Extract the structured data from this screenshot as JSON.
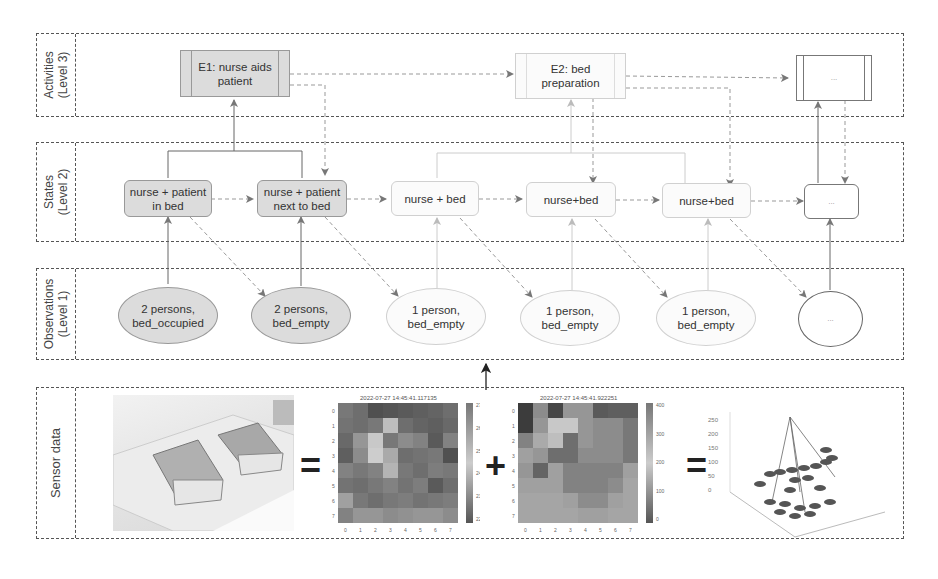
{
  "layers": {
    "activities": "Activities\n(Level 3)",
    "states": "States\n(Level 2)",
    "observations": "Observations\n(Level 1)",
    "sensor": "Sensor data"
  },
  "activities": [
    {
      "label": "E1: nurse aids\npatient",
      "style": "filled"
    },
    {
      "label": "E2: bed\npreparation",
      "style": "light"
    },
    {
      "label": "...",
      "style": "outline"
    }
  ],
  "states": [
    {
      "label": "nurse + patient\nin bed",
      "style": "filled"
    },
    {
      "label": "nurse + patient\nnext to bed",
      "style": "filled"
    },
    {
      "label": "nurse + bed",
      "style": "light"
    },
    {
      "label": "nurse+bed",
      "style": "light"
    },
    {
      "label": "nurse+bed",
      "style": "light"
    },
    {
      "label": "...",
      "style": "outline"
    }
  ],
  "observations": [
    {
      "label": "2 persons,\nbed_occupied",
      "style": "filled"
    },
    {
      "label": "2 persons,\nbed_empty",
      "style": "filled"
    },
    {
      "label": "1 person,\nbed_empty",
      "style": "light"
    },
    {
      "label": "1 person,\nbed_empty",
      "style": "light"
    },
    {
      "label": "1 person,\nbed_empty",
      "style": "light"
    },
    {
      "label": "...",
      "style": "outline"
    }
  ],
  "sensor": {
    "operators": [
      "=",
      "+",
      "="
    ],
    "heatmap1": {
      "title": "2022-07-27 14:45:41.117135",
      "colorbar_ticks": [
        "27",
        "26",
        "25",
        "24",
        "23",
        "22"
      ],
      "x_ticks": [
        "0",
        "1",
        "2",
        "3",
        "4",
        "5",
        "6",
        "7"
      ],
      "y_ticks": [
        "0",
        "1",
        "2",
        "3",
        "4",
        "5",
        "6",
        "7"
      ]
    },
    "heatmap2": {
      "title": "2022-07-27 14:45:41.922251",
      "colorbar_ticks": [
        "400",
        "300",
        "200",
        "100",
        "0"
      ],
      "x_ticks": [
        "0",
        "1",
        "2",
        "3",
        "4",
        "5",
        "6",
        "7"
      ],
      "y_ticks": [
        "0",
        "1",
        "2",
        "3",
        "4",
        "5",
        "6",
        "7"
      ]
    },
    "plot3d": {
      "z_ticks": [
        "250",
        "200",
        "150",
        "100",
        "50",
        "0"
      ]
    }
  },
  "colors": {
    "filled": "#dcdcdc",
    "light": "#fbfbfb",
    "border": "#555555"
  }
}
